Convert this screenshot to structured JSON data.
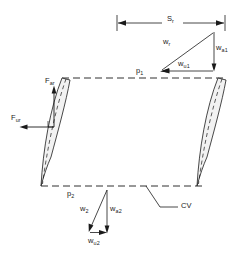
{
  "figure": {
    "type": "turbomachinery-blade-cascade-control-volume-diagram",
    "background_color": "#ffffff",
    "line_color": "#1a1a1a",
    "blade_fill": "#f2f2f2"
  },
  "labels": {
    "pitch": {
      "base": "S",
      "sub": "r",
      "full": "S_r"
    },
    "inlet_pressure": {
      "base": "p",
      "sub": "1",
      "full": "p_1"
    },
    "outlet_pressure": {
      "base": "p",
      "sub": "2",
      "full": "p_2"
    },
    "control_volume": {
      "base": "CV",
      "sub": "",
      "full": "CV"
    },
    "force_axial": {
      "base": "F",
      "sub": "ar",
      "full": "F_ar"
    },
    "force_tangential": {
      "base": "F",
      "sub": "ur",
      "full": "F_ur"
    },
    "rel_velocity_1": {
      "base": "w",
      "sub": "r",
      "full": "w_r"
    },
    "axial_velocity_1": {
      "base": "w",
      "sub": "a1",
      "full": "w_a1"
    },
    "tangential_velocity_1": {
      "base": "w",
      "sub": "u1",
      "full": "w_u1"
    },
    "rel_velocity_2": {
      "base": "w",
      "sub": "2",
      "full": "w_2"
    },
    "axial_velocity_2": {
      "base": "w",
      "sub": "a2",
      "full": "w_a2"
    },
    "tangential_velocity_2": {
      "base": "w",
      "sub": "u2",
      "full": "w_u2"
    }
  },
  "geometry": {
    "pitch_dimension_line": {
      "y": 23,
      "x_start": 117,
      "x_end": 225
    },
    "cv_top_boundary": {
      "y": 78,
      "x_start": 62,
      "x_end": 225
    },
    "cv_bottom_boundary": {
      "y": 185,
      "x_start": 42,
      "x_end": 205
    },
    "blade_count": 2
  }
}
